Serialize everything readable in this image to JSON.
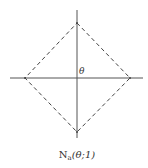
{
  "diagram": {
    "type": "dashed diamond neighborhood on coordinate axes",
    "center_label": "θ",
    "caption": {
      "main": "N",
      "subscript": "a",
      "args": "(θ;1)"
    },
    "shape": "diamond (L1 unit ball)",
    "colors": {
      "background": "#ffffff",
      "axis": "#555555",
      "diamond": "#444444",
      "text": "#333333"
    }
  }
}
